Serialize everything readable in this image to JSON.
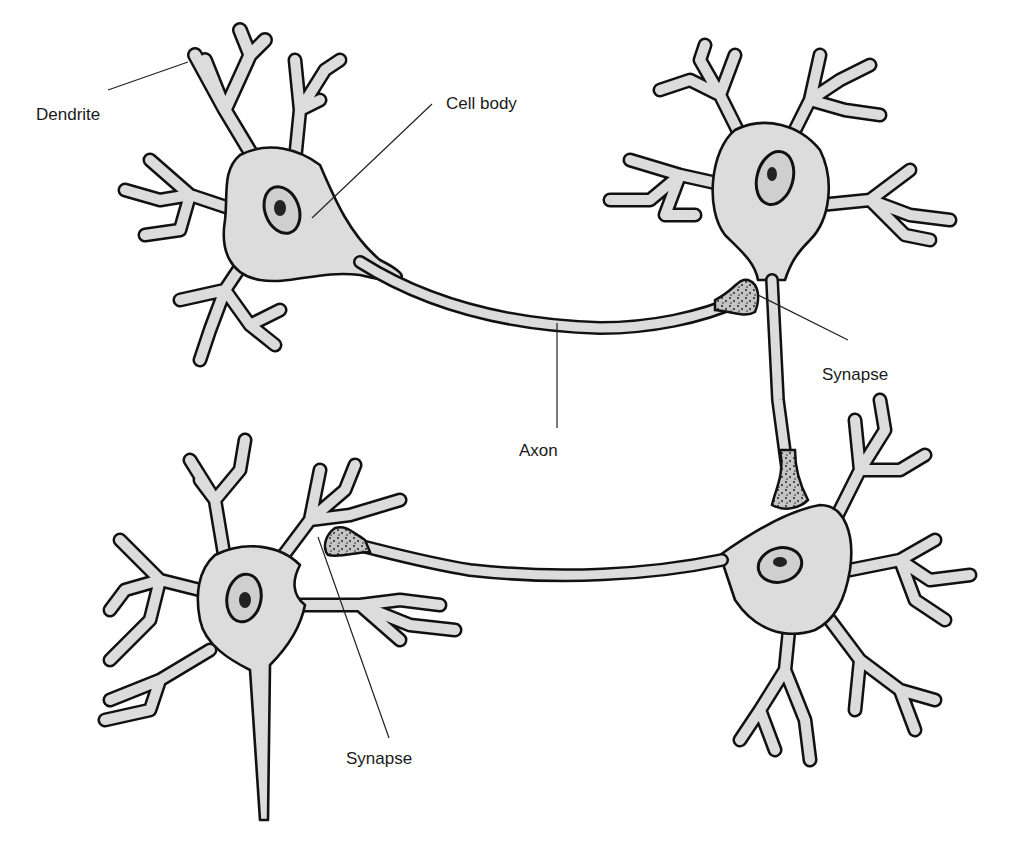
{
  "diagram": {
    "colors": {
      "background": "#ffffff",
      "cell_fill": "#dcdcdc",
      "outline": "#111111",
      "label_text": "#1a1a1a"
    },
    "labels": {
      "dendrite": "Dendrite",
      "cell_body": "Cell body",
      "synapse_upper": "Synapse",
      "axon": "Axon",
      "synapse_lower": "Synapse"
    },
    "neurons": [
      {
        "id": "neuron-top-left",
        "role": "presynaptic"
      },
      {
        "id": "neuron-top-right",
        "role": "postsynaptic / presynaptic"
      },
      {
        "id": "neuron-bottom-right",
        "role": "postsynaptic / presynaptic"
      },
      {
        "id": "neuron-bottom-left",
        "role": "postsynaptic"
      }
    ]
  }
}
